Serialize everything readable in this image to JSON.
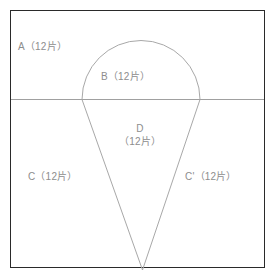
{
  "page": {
    "top_fragment_text": "— — ——",
    "background_color": "#ffffff"
  },
  "figure": {
    "frame": {
      "border_color": "#2a2a2a",
      "x": 10,
      "y": 10,
      "width": 255,
      "height": 258
    },
    "divider_line": {
      "color": "#a0a0a0",
      "y": 99,
      "x_start": 11,
      "x_end": 264
    },
    "teardrop": {
      "stroke_color": "#a8a8a8",
      "arc_apex_y": 42,
      "arc_left_x": 82,
      "arc_right_x": 200,
      "arc_center_x": 141,
      "tip_x": 142,
      "tip_y": 270
    },
    "labels": [
      {
        "id": "A",
        "name": "region-label-a",
        "text": "A（12片）",
        "x": 18,
        "y": 40
      },
      {
        "id": "B",
        "name": "region-label-b",
        "text": "B（12片）",
        "x": 101,
        "y": 70
      },
      {
        "id": "D",
        "name": "region-label-d",
        "line1": "D",
        "line2": "（12片）",
        "x": 106,
        "y": 122
      },
      {
        "id": "C",
        "name": "region-label-c",
        "text": "C（12片）",
        "x": 28,
        "y": 170
      },
      {
        "id": "C'",
        "name": "region-label-c-prime",
        "text": "C'（12片）",
        "x": 185,
        "y": 170
      }
    ],
    "label_color": "#8d8d8d",
    "piece_count": "12",
    "piece_unit": "片"
  }
}
